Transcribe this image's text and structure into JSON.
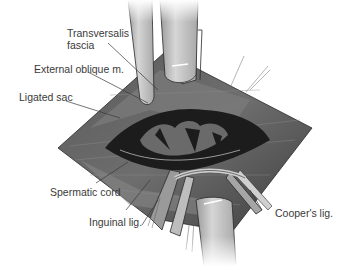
{
  "figure": {
    "style": "grayscale illustration",
    "colors": {
      "background": "#ffffff",
      "tissue_dark": "#4a4a4a",
      "tissue_mid": "#7a7a7a",
      "tissue_light": "#b5b5b5",
      "cavity": "#1a1a1a",
      "retractor": "#c8c8c8",
      "label_text": "#3a3a3a"
    }
  },
  "labels": [
    {
      "id": "transversalis",
      "line1": "Transversalis",
      "line2": "fascia"
    },
    {
      "id": "external_oblique",
      "text": "External oblique m."
    },
    {
      "id": "ligated_sac",
      "text": "Ligated sac"
    },
    {
      "id": "spermatic_cord",
      "text": "Spermatic cord"
    },
    {
      "id": "inguinal_lig",
      "text": "Inguinal lig."
    },
    {
      "id": "coopers_lig",
      "text": "Cooper's lig."
    }
  ]
}
